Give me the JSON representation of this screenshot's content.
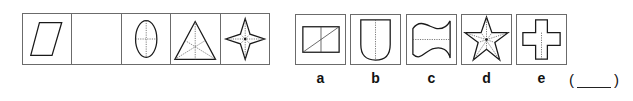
{
  "puzzle": {
    "sequence": [
      {
        "id": 1,
        "shape": "parallelogram",
        "symmetry_axes": 0
      },
      {
        "id": 2,
        "shape": "empty",
        "symmetry_axes": null
      },
      {
        "id": 3,
        "shape": "ellipse",
        "symmetry_axes": 2
      },
      {
        "id": 4,
        "shape": "equilateral-triangle",
        "symmetry_axes": 3
      },
      {
        "id": 5,
        "shape": "four-pointed-star",
        "symmetry_axes": 4
      }
    ],
    "options": [
      {
        "label": "a",
        "shape": "rectangle-with-diagonal"
      },
      {
        "label": "b",
        "shape": "shield"
      },
      {
        "label": "c",
        "shape": "wave-flag"
      },
      {
        "label": "d",
        "shape": "five-pointed-star"
      },
      {
        "label": "e",
        "shape": "cross"
      }
    ],
    "answer": {
      "open_paren": "(",
      "close_paren": ")",
      "value": ""
    }
  },
  "colors": {
    "border": "#6b6b6b",
    "stroke": "#1a1a1a",
    "dashed": "#555555",
    "background": "#ffffff"
  }
}
